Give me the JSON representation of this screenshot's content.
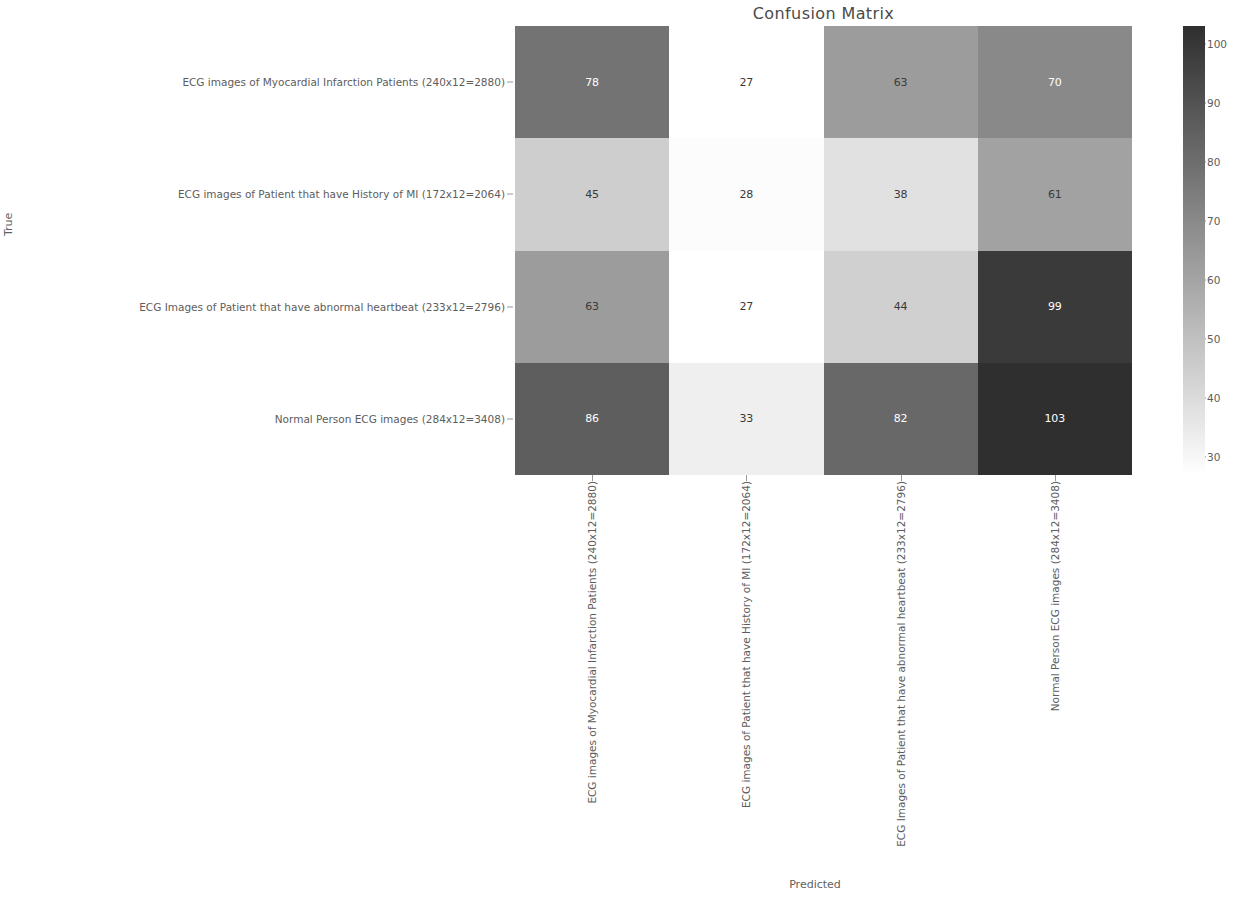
{
  "chart_data": {
    "type": "heatmap",
    "title": "Confusion Matrix",
    "xlabel": "Predicted",
    "ylabel": "True",
    "categories": [
      "ECG images of Myocardial Infarction Patients (240x12=2880)",
      "ECG images of Patient that have History of MI (172x12=2064)",
      "ECG Images of Patient that have abnormal heartbeat (233x12=2796)",
      "Normal Person ECG images (284x12=3408)"
    ],
    "row_labels": [
      "ECG images of Myocardial Infarction Patients (240x12=2880)",
      "ECG images of Patient that have History of MI (172x12=2064)",
      "ECG Images of Patient that have abnormal heartbeat (233x12=2796)",
      "Normal Person ECG images (284x12=3408)"
    ],
    "col_labels": [
      "ECG images of Myocardial Infarction Patients (240x12=2880)",
      "ECG images of Patient that have History of MI (172x12=2064)",
      "ECG Images of Patient that have abnormal heartbeat (233x12=2796)",
      "Normal Person ECG images (284x12=3408)"
    ],
    "values": [
      [
        78,
        27,
        63,
        70
      ],
      [
        45,
        28,
        38,
        61
      ],
      [
        63,
        27,
        44,
        99
      ],
      [
        86,
        33,
        82,
        103
      ]
    ],
    "cell_text": [
      [
        "78",
        "27",
        "63",
        "70"
      ],
      [
        "45",
        "28",
        "38",
        "61"
      ],
      [
        "63",
        "27",
        "44",
        "99"
      ],
      [
        "86",
        "33",
        "82",
        "103"
      ]
    ],
    "colormap": "greys",
    "colorbar_ticks": [
      100,
      90,
      80,
      70,
      60,
      50,
      40,
      30
    ],
    "colorbar_tick_labels": [
      "100",
      "90",
      "80",
      "70",
      "60",
      "50",
      "40",
      "30"
    ],
    "vmin": 27,
    "vmax": 103,
    "grid": false,
    "legend": "colorbar-right",
    "color_low": "#ffffff",
    "color_high": "#2f2f2f"
  }
}
